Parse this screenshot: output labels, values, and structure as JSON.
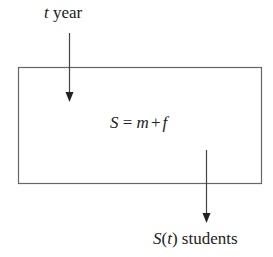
{
  "diagram": {
    "input": {
      "variable": "t",
      "unit": "year"
    },
    "box": {
      "lhs": "S",
      "eq": "=",
      "term1": "m",
      "op": "+",
      "term2": "f"
    },
    "output": {
      "function": "S",
      "open": "(",
      "arg": "t",
      "close": ")",
      "unit": "students"
    },
    "colors": {
      "line": "#555555",
      "text": "#222222"
    }
  }
}
